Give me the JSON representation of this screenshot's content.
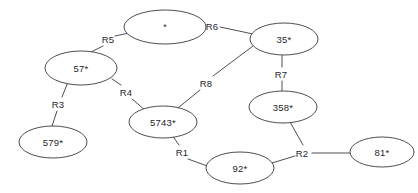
{
  "diagram": {
    "type": "graph",
    "title": "",
    "node_shape": "ellipse",
    "colors": {
      "background": "#ffffff",
      "stroke": "#3a3a42",
      "text": "#26262c",
      "node_fill": "#ffffff"
    },
    "nodes": [
      {
        "id": "n_star",
        "label": "*",
        "cx": 165,
        "cy": 27,
        "rx": 41,
        "ry": 17
      },
      {
        "id": "n_35",
        "label": "35*",
        "cx": 284,
        "cy": 39,
        "rx": 34,
        "ry": 16
      },
      {
        "id": "n_57",
        "label": "57*",
        "cx": 81,
        "cy": 68,
        "rx": 36,
        "ry": 17
      },
      {
        "id": "n_5743",
        "label": "5743*",
        "cx": 163,
        "cy": 122,
        "rx": 34,
        "ry": 16
      },
      {
        "id": "n_358",
        "label": "358*",
        "cx": 283,
        "cy": 107,
        "rx": 34,
        "ry": 16
      },
      {
        "id": "n_579",
        "label": "579*",
        "cx": 53,
        "cy": 142,
        "rx": 34,
        "ry": 16
      },
      {
        "id": "n_92",
        "label": "92*",
        "cx": 240,
        "cy": 168,
        "rx": 34,
        "ry": 16
      },
      {
        "id": "n_81",
        "label": "81*",
        "cx": 382,
        "cy": 152,
        "rx": 32,
        "ry": 15
      }
    ],
    "edge_labels": [
      {
        "id": "r1",
        "label": "R1",
        "x": 182,
        "y": 152
      },
      {
        "id": "r2",
        "label": "R2",
        "x": 302,
        "y": 153
      },
      {
        "id": "r3",
        "label": "R3",
        "x": 58,
        "y": 104
      },
      {
        "id": "r4",
        "label": "R4",
        "x": 126,
        "y": 92
      },
      {
        "id": "r5",
        "label": "R5",
        "x": 108,
        "y": 39
      },
      {
        "id": "r6",
        "label": "R6",
        "x": 212,
        "y": 26
      },
      {
        "id": "r7",
        "label": "R7",
        "x": 281,
        "y": 74
      },
      {
        "id": "r8",
        "label": "R8",
        "x": 206,
        "y": 83
      }
    ],
    "edges": [
      {
        "id": "e_r5_star",
        "from": "n_star",
        "to": "r5",
        "label_ref": "R5",
        "x1": 129,
        "y1": 33,
        "x2": 115,
        "y2": 36
      },
      {
        "id": "e_r5_57",
        "from": "r5",
        "to": "n_57",
        "label_ref": "R5",
        "x1": 103,
        "y1": 46,
        "x2": 91,
        "y2": 52
      },
      {
        "id": "e_r6_star",
        "from": "n_star",
        "to": "r6",
        "label_ref": "R6",
        "x1": 199,
        "y1": 24,
        "x2": 205,
        "y2": 25
      },
      {
        "id": "e_r6_35",
        "from": "r6",
        "to": "n_35",
        "label_ref": "R6",
        "x1": 220,
        "y1": 27,
        "x2": 253,
        "y2": 34
      },
      {
        "id": "e_r8_35",
        "from": "n_35",
        "to": "r8",
        "label_ref": "R8",
        "x1": 253,
        "y1": 46,
        "x2": 213,
        "y2": 76
      },
      {
        "id": "e_r8_5743",
        "from": "r8",
        "to": "n_5743",
        "label_ref": "R8",
        "x1": 200,
        "y1": 90,
        "x2": 178,
        "y2": 108
      },
      {
        "id": "e_r7_35",
        "from": "n_35",
        "to": "r7",
        "label_ref": "R7",
        "x1": 282,
        "y1": 55,
        "x2": 282,
        "y2": 67
      },
      {
        "id": "e_r7_358",
        "from": "r7",
        "to": "n_358",
        "label_ref": "R7",
        "x1": 282,
        "y1": 81,
        "x2": 282,
        "y2": 91
      },
      {
        "id": "e_r3_57",
        "from": "n_57",
        "to": "r3",
        "label_ref": "R3",
        "x1": 68,
        "y1": 82,
        "x2": 62,
        "y2": 97
      },
      {
        "id": "e_r3_579",
        "from": "r3",
        "to": "n_579",
        "label_ref": "R3",
        "x1": 57,
        "y1": 111,
        "x2": 52,
        "y2": 126
      },
      {
        "id": "e_r4_57",
        "from": "n_57",
        "to": "r4",
        "label_ref": "R4",
        "x1": 112,
        "y1": 79,
        "x2": 121,
        "y2": 85
      },
      {
        "id": "e_r4_5743",
        "from": "r4",
        "to": "n_5743",
        "label_ref": "R4",
        "x1": 132,
        "y1": 99,
        "x2": 145,
        "y2": 110
      },
      {
        "id": "e_r1_5743",
        "from": "n_5743",
        "to": "r1",
        "label_ref": "R1",
        "x1": 172,
        "y1": 135,
        "x2": 179,
        "y2": 145
      },
      {
        "id": "e_r1_92",
        "from": "r1",
        "to": "n_92",
        "label_ref": "R1",
        "x1": 188,
        "y1": 159,
        "x2": 210,
        "y2": 167
      },
      {
        "id": "e_r2_92",
        "from": "n_92",
        "to": "r2",
        "label_ref": "R2",
        "x1": 272,
        "y1": 163,
        "x2": 295,
        "y2": 156
      },
      {
        "id": "e_r2_358",
        "from": "n_358",
        "to": "r2",
        "label_ref": "R2",
        "x1": 290,
        "y1": 122,
        "x2": 303,
        "y2": 145
      },
      {
        "id": "e_r2_81",
        "from": "r2",
        "to": "n_81",
        "label_ref": "R2",
        "x1": 312,
        "y1": 153,
        "x2": 350,
        "y2": 153
      }
    ]
  }
}
